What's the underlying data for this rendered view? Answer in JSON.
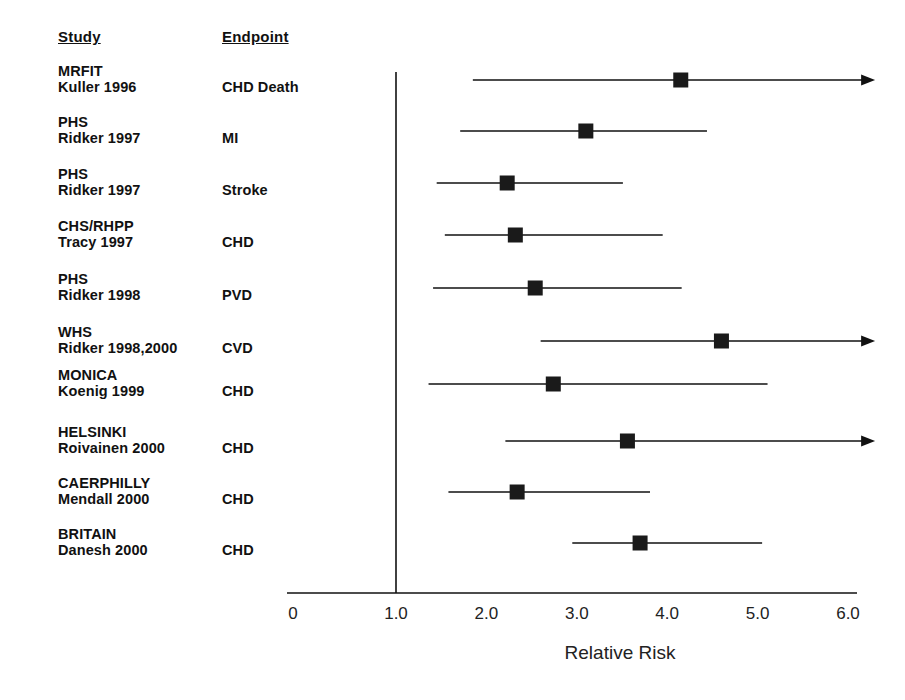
{
  "header": {
    "study_label": "Study",
    "endpoint_label": "Endpoint"
  },
  "axis": {
    "title": "Relative Risk",
    "ticks": [
      "0",
      "1.0",
      "2.0",
      "3.0",
      "4.0",
      "5.0",
      "6.0"
    ],
    "reference_value": "1.0"
  },
  "rows": [
    {
      "study_name": "MRFIT",
      "study_ref": "Kuller 1996",
      "endpoint": "CHD Death"
    },
    {
      "study_name": "PHS",
      "study_ref": "Ridker 1997",
      "endpoint": "MI"
    },
    {
      "study_name": "PHS",
      "study_ref": "Ridker 1997",
      "endpoint": "Stroke"
    },
    {
      "study_name": "CHS/RHPP",
      "study_ref": "Tracy 1997",
      "endpoint": "CHD"
    },
    {
      "study_name": "PHS",
      "study_ref": "Ridker 1998",
      "endpoint": "PVD"
    },
    {
      "study_name": "WHS",
      "study_ref": "Ridker 1998,2000",
      "endpoint": "CVD"
    },
    {
      "study_name": "MONICA",
      "study_ref": "Koenig 1999",
      "endpoint": "CHD"
    },
    {
      "study_name": "HELSINKI",
      "study_ref": "Roivainen 2000",
      "endpoint": "CHD"
    },
    {
      "study_name": "CAERPHILLY",
      "study_ref": "Mendall 2000",
      "endpoint": "CHD"
    },
    {
      "study_name": "BRITAIN",
      "study_ref": "Danesh 2000",
      "endpoint": "CHD"
    }
  ],
  "chart_data": {
    "type": "scatter",
    "title": "",
    "xlabel": "Relative Risk",
    "ylabel": "",
    "xlim": [
      0,
      6.3
    ],
    "grid": false,
    "legend": "none",
    "reference_line": 1.0,
    "xticks": [
      0,
      1.0,
      2.0,
      3.0,
      4.0,
      5.0,
      6.0
    ],
    "xticklabels": [
      "0",
      "1.0",
      "2.0",
      "3.0",
      "4.0",
      "5.0",
      "6.0"
    ],
    "categories": [
      "MRFIT Kuller 1996 - CHD Death",
      "PHS Ridker 1997 - MI",
      "PHS Ridker 1997 - Stroke",
      "CHS/RHPP Tracy 1997 - CHD",
      "PHS Ridker 1998 - PVD",
      "WHS Ridker 1998,2000 - CVD",
      "MONICA Koenig 1999 - CHD",
      "HELSINKI Roivainen 2000 - CHD",
      "CAERPHILLY Mendall 2000 - CHD",
      "BRITAIN Danesh 2000 - CHD"
    ],
    "point_estimates": [
      4.15,
      3.1,
      2.23,
      2.32,
      2.54,
      4.6,
      2.74,
      3.56,
      2.34,
      3.7
    ],
    "ci_low": [
      1.85,
      1.71,
      1.45,
      1.54,
      1.41,
      2.6,
      1.36,
      2.21,
      1.58,
      2.95
    ],
    "ci_high": [
      6.3,
      4.44,
      3.51,
      3.95,
      4.16,
      6.3,
      5.11,
      6.3,
      3.81,
      5.05
    ],
    "ci_high_truncated": [
      true,
      false,
      false,
      false,
      false,
      true,
      false,
      true,
      false,
      false
    ],
    "marker": "filled-square"
  },
  "colors": {
    "ink": "#111111",
    "marker": "#1a1a1a",
    "background": "#ffffff"
  }
}
